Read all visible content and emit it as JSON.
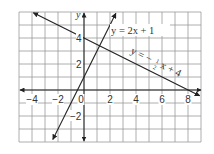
{
  "chart_data": {
    "type": "line",
    "title": "",
    "xlabel": "",
    "ylabel": "y",
    "xlim": [
      -5,
      9
    ],
    "ylim": [
      -4,
      6
    ],
    "grid": true,
    "x_ticks": [
      "-4",
      "-2",
      "0",
      "2",
      "4",
      "6",
      "8"
    ],
    "y_ticks": [
      "4",
      "2",
      "-2"
    ],
    "series": [
      {
        "name": "y = 2x + 1",
        "slope": 2,
        "intercept": 1,
        "label": "y = 2x + 1"
      },
      {
        "name": "y = -1/2 x + 4",
        "slope": -0.5,
        "intercept": 4,
        "label": "y = −½x + 4"
      }
    ],
    "intersection": {
      "x": 1.2,
      "y": 3.4
    }
  },
  "labels": {
    "y_axis": "y",
    "eq1": "y = 2x + 1",
    "eq2_prefix": "y = −",
    "eq2_frac_num": "1",
    "eq2_frac_den": "2",
    "eq2_suffix": "x + 4",
    "xt": [
      "−4",
      "−2",
      "0",
      "2",
      "4",
      "6",
      "8"
    ],
    "yt4": "4",
    "yt2": "2",
    "ytm2": "−2"
  }
}
